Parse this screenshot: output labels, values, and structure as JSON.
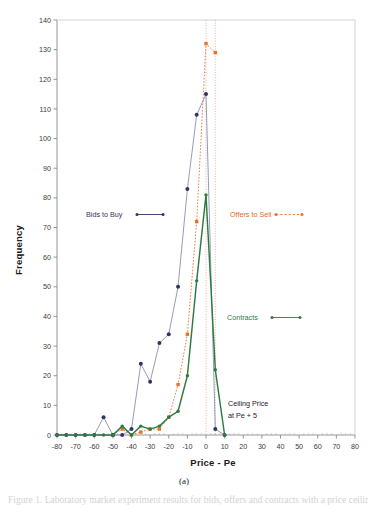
{
  "figure": {
    "caption": "(a)",
    "bottom_text_fragment": "Figure 1. Laboratory market experiment results for bids, offers and contracts with a price ceiling"
  },
  "chart_data": {
    "type": "line",
    "title": "",
    "xlabel": "Price - Pe",
    "ylabel": "Frequency",
    "xlim": [
      -80,
      80
    ],
    "ylim": [
      0,
      140
    ],
    "xticks": [
      -80,
      -70,
      -60,
      -50,
      -40,
      -30,
      -20,
      -10,
      0,
      10,
      20,
      30,
      40,
      50,
      60,
      70,
      80
    ],
    "yticks": [
      0,
      10,
      20,
      30,
      40,
      50,
      60,
      70,
      80,
      90,
      100,
      110,
      120,
      130,
      140
    ],
    "xtick_labels": [
      "-80",
      "-70",
      "-60",
      "-50",
      "-40",
      "-30",
      "-20",
      "-10",
      "0",
      "10",
      "20",
      "30",
      "40",
      "50",
      "60",
      "70",
      "80"
    ],
    "ytick_labels": [
      "0",
      "10",
      "20",
      "30",
      "40",
      "50",
      "60",
      "70",
      "80",
      "90",
      "100",
      "110",
      "120",
      "130",
      "140"
    ],
    "grid": false,
    "legend_position": "inline-annotations",
    "series": [
      {
        "name": "Bids to Buy",
        "color": "#2e3566",
        "line_style": "solid",
        "marker": "circle",
        "x": [
          -80,
          -75,
          -70,
          -65,
          -60,
          -55,
          -50,
          -45,
          -40,
          -35,
          -30,
          -25,
          -20,
          -15,
          -10,
          -5,
          0,
          5,
          10
        ],
        "values": [
          0,
          0,
          0,
          0,
          0,
          6,
          0,
          0,
          2,
          24,
          18,
          31,
          34,
          50,
          83,
          108,
          115,
          2,
          0
        ]
      },
      {
        "name": "Offers to Sell",
        "color": "#e8722a",
        "line_style": "dotted",
        "marker": "square",
        "x": [
          -50,
          -45,
          -40,
          -35,
          -30,
          -25,
          -20,
          -15,
          -10,
          -5,
          0,
          5
        ],
        "values": [
          0,
          2,
          0,
          1,
          2,
          2,
          6,
          17,
          34,
          72,
          132,
          129
        ]
      },
      {
        "name": "Contracts",
        "color": "#2f7a42",
        "line_style": "solid",
        "marker": "circle",
        "x": [
          -80,
          -75,
          -70,
          -65,
          -60,
          -55,
          -50,
          -45,
          -40,
          -35,
          -30,
          -25,
          -20,
          -15,
          -10,
          -5,
          0,
          5,
          10
        ],
        "values": [
          0,
          0,
          0,
          0,
          0,
          0,
          0,
          3,
          0,
          3,
          2,
          3,
          6,
          8,
          20,
          52,
          81,
          22,
          0
        ]
      }
    ],
    "annotations": [
      {
        "text": "Bids to Buy",
        "color": "#2e3566",
        "style": "solid-arrow",
        "target_x": -16,
        "target_y": 75
      },
      {
        "text": "Offers to Sell",
        "color": "#e8722a",
        "style": "dashed-arrow",
        "target_x": 38,
        "target_y": 75
      },
      {
        "text": "Contracts",
        "color": "#2f7a42",
        "style": "solid-arrow",
        "target_x": 45,
        "target_y": 38
      },
      {
        "text": "Ceiling Price",
        "color": "#1a1a1a",
        "style": "plain",
        "line2": "at Pe + 5"
      }
    ],
    "ceiling_price_note": {
      "line1": "Ceiling Price",
      "line2": "at Pe + 5",
      "value_x": 5
    }
  }
}
